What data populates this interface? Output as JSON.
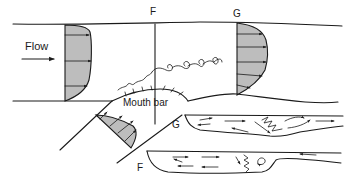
{
  "diagram": {
    "labels": {
      "flow": "Flow",
      "section_f_top": "F",
      "section_g_top": "G",
      "mouth_bar": "Mouth bar",
      "section_g_profile": "G",
      "section_f_profile": "F"
    },
    "colors": {
      "line": "#1a1a1a",
      "shading": "#bdbdbd",
      "background": "#ffffff"
    },
    "elements": [
      "upper channel with inflow velocity profile",
      "section F vertical line",
      "section G velocity profile",
      "mouth bar with ripples",
      "wave vortices (Kelvin-Helmholtz) at bar crest",
      "oblique channel with velocity profile",
      "longitudinal section G with recirculation arrows",
      "longitudinal section F with recirculation arrows"
    ]
  }
}
